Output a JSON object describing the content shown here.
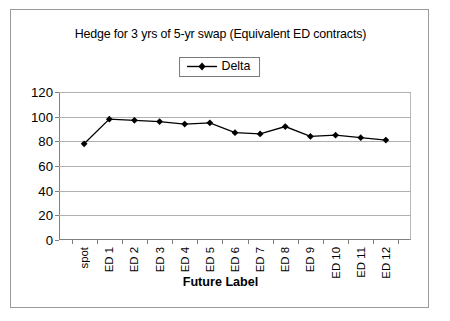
{
  "chart_data": {
    "type": "line",
    "title": "Hedge for 3 yrs of 5-yr swap (Equivalent ED contracts)",
    "xlabel": "Future Label",
    "ylabel": "",
    "categories": [
      "spot",
      "ED 1",
      "ED 2",
      "ED 3",
      "ED 4",
      "ED 5",
      "ED 6",
      "ED 7",
      "ED 8",
      "ED 9",
      "ED 10",
      "ED 11",
      "ED 12"
    ],
    "series": [
      {
        "name": "Delta",
        "color": "#000000",
        "marker": "diamond",
        "values": [
          78,
          98,
          97,
          96,
          94,
          95,
          87,
          86,
          92,
          84,
          85,
          83,
          81
        ]
      }
    ],
    "ylim": [
      0,
      120
    ],
    "ytick_values": [
      0,
      20,
      40,
      60,
      80,
      100,
      120
    ],
    "ytick_labels": [
      "0",
      "20",
      "40",
      "60",
      "80",
      "100",
      "120"
    ],
    "grid": true,
    "grid_axis": "y",
    "legend": {
      "position": "top-center",
      "entries": [
        "Delta"
      ]
    },
    "frame_border": true
  }
}
